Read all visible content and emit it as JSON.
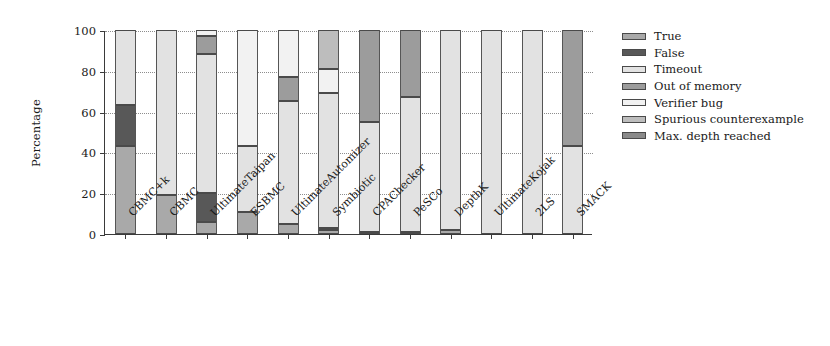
{
  "chart_data": {
    "type": "bar",
    "title": "",
    "subtitle": "",
    "xlabel": "",
    "ylabel": "Percentage",
    "ylim": [
      0,
      100
    ],
    "yticks": [
      0,
      20,
      40,
      60,
      80,
      100
    ],
    "grid": true,
    "stacked": true,
    "legend_position": "right",
    "categories": [
      "CBMC+k",
      "CBMC",
      "UltimateTaipan",
      "ESBMC",
      "UltimateAutomizer",
      "Symbiotic",
      "CPAChecker",
      "PeSCo",
      "DepthK",
      "UltimateKojak",
      "2LS",
      "SMACK"
    ],
    "series": [
      {
        "name": "True",
        "color": "#a9a9a9",
        "values": [
          43,
          19,
          6,
          11,
          5,
          2,
          1,
          1,
          2,
          0,
          0,
          0
        ]
      },
      {
        "name": "False",
        "color": "#585858",
        "values": [
          20,
          0,
          14,
          0,
          0,
          1,
          0,
          0,
          0,
          0,
          0,
          0
        ]
      },
      {
        "name": "Timeout",
        "color": "#e2e2e2",
        "values": [
          37,
          81,
          68,
          32,
          60,
          66,
          54,
          66,
          98,
          100,
          100,
          43
        ]
      },
      {
        "name": "Out of memory",
        "color": "#9c9c9c",
        "values": [
          0,
          0,
          9,
          0,
          12,
          0,
          45,
          33,
          0,
          0,
          0,
          57
        ]
      },
      {
        "name": "Verifier bug",
        "color": "#f2f2f2",
        "values": [
          0,
          0,
          3,
          57,
          23,
          12,
          0,
          0,
          0,
          0,
          0,
          0
        ]
      },
      {
        "name": "Spurious counterexample",
        "color": "#bdbdbd",
        "values": [
          0,
          0,
          0,
          0,
          0,
          19,
          0,
          0,
          0,
          0,
          0,
          0
        ]
      },
      {
        "name": "Max. depth reached",
        "color": "#8a8a8a",
        "values": [
          0,
          0,
          0,
          0,
          0,
          0,
          0,
          0,
          0,
          0,
          0,
          0
        ]
      }
    ]
  },
  "legend": {
    "items": [
      {
        "label": "True"
      },
      {
        "label": "False"
      },
      {
        "label": "Timeout"
      },
      {
        "label": "Out of memory"
      },
      {
        "label": "Verifier bug"
      },
      {
        "label": "Spurious counterexample"
      },
      {
        "label": "Max. depth reached"
      }
    ]
  }
}
